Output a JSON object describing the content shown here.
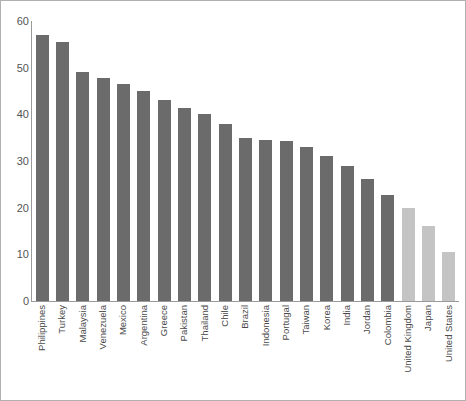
{
  "chart_data": {
    "type": "bar",
    "title": "",
    "subtitle": "",
    "xlabel": "",
    "ylabel": "",
    "ylim": [
      0,
      60
    ],
    "yticks": [
      0,
      10,
      20,
      30,
      40,
      50,
      60
    ],
    "grid": false,
    "legend": null,
    "categories": [
      "Philippines",
      "Turkey",
      "Malaysia",
      "Venezuela",
      "Mexico",
      "Argentina",
      "Greece",
      "Pakistan",
      "Thailand",
      "Chile",
      "Brazil",
      "Indonesia",
      "Portugal",
      "Taiwan",
      "Korea",
      "India",
      "Jordan",
      "Colombia",
      "United Kingdom",
      "Japan",
      "United States"
    ],
    "values": [
      57.0,
      55.5,
      49.0,
      47.8,
      46.5,
      45.0,
      43.0,
      41.3,
      40.0,
      38.0,
      35.0,
      34.5,
      34.3,
      33.0,
      31.0,
      29.0,
      26.2,
      22.7,
      20.0,
      16.0,
      10.5
    ],
    "bar_colors": [
      "#6b6b6b",
      "#6b6b6b",
      "#6b6b6b",
      "#6b6b6b",
      "#6b6b6b",
      "#6b6b6b",
      "#6b6b6b",
      "#6b6b6b",
      "#6b6b6b",
      "#6b6b6b",
      "#6b6b6b",
      "#6b6b6b",
      "#6b6b6b",
      "#6b6b6b",
      "#6b6b6b",
      "#6b6b6b",
      "#6b6b6b",
      "#6b6b6b",
      "#c4c4c4",
      "#c4c4c4",
      "#c4c4c4"
    ]
  },
  "style": {
    "dark_bar_color": "#6b6b6b",
    "light_bar_color": "#c4c4c4",
    "axis_color": "#9a9a9a",
    "tick_text_color": "#555555",
    "label_text_color": "#4a4a4a",
    "frame_color": "#b0b0b0",
    "background": "#ffffff"
  }
}
